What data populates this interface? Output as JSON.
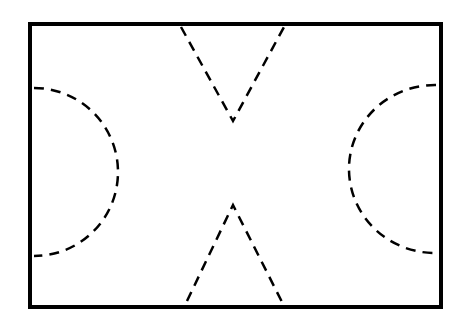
{
  "diagram": {
    "type": "field-layout",
    "background": "#ffffff",
    "stroke_color": "#000000",
    "boundary": {
      "x": 30,
      "y": 24,
      "width": 411,
      "height": 283,
      "stroke_width": 4
    },
    "dash_pattern": "10 7",
    "dashed_stroke_width": 2.5,
    "top_v": {
      "left_start": [
        181,
        27
      ],
      "apex": [
        233,
        121
      ],
      "right_start": [
        284,
        27
      ]
    },
    "bottom_v": {
      "left_end": [
        187,
        301
      ],
      "apex": [
        233,
        205
      ],
      "right_end": [
        282,
        302
      ]
    },
    "left_arc": {
      "start": [
        34,
        88
      ],
      "end": [
        34,
        256
      ],
      "rx": 84,
      "ry": 84
    },
    "right_arc": {
      "start": [
        436,
        85
      ],
      "end": [
        434,
        253
      ],
      "rx": 86,
      "ry": 84
    }
  }
}
